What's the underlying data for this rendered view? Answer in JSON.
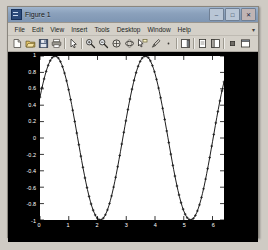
{
  "window": {
    "title": "Figure 1",
    "icon": "matlab-figure-icon",
    "controls": [
      {
        "name": "minimize",
        "glyph": "–"
      },
      {
        "name": "maximize",
        "glyph": "□"
      },
      {
        "name": "close",
        "glyph": "✕"
      }
    ]
  },
  "menubar": {
    "items": [
      {
        "label": "File",
        "mnemonic": "F"
      },
      {
        "label": "Edit",
        "mnemonic": "E"
      },
      {
        "label": "View",
        "mnemonic": "V"
      },
      {
        "label": "Insert",
        "mnemonic": "I"
      },
      {
        "label": "Tools",
        "mnemonic": "T"
      },
      {
        "label": "Desktop",
        "mnemonic": "D"
      },
      {
        "label": "Window",
        "mnemonic": "W"
      },
      {
        "label": "Help",
        "mnemonic": "H"
      }
    ],
    "overflow_glyph": "▾"
  },
  "toolbar": {
    "buttons": [
      {
        "name": "new-figure-icon",
        "tip": "New Figure"
      },
      {
        "name": "open-file-icon",
        "tip": "Open File"
      },
      {
        "name": "save-figure-icon",
        "tip": "Save Figure"
      },
      {
        "name": "print-figure-icon",
        "tip": "Print Figure"
      },
      {
        "name": "edit-plot-arrow-icon",
        "tip": "Edit Plot"
      },
      {
        "name": "zoom-in-icon",
        "tip": "Zoom In"
      },
      {
        "name": "zoom-out-icon",
        "tip": "Zoom Out"
      },
      {
        "name": "pan-icon",
        "tip": "Pan"
      },
      {
        "name": "rotate-3d-icon",
        "tip": "Rotate 3D"
      },
      {
        "name": "data-cursor-icon",
        "tip": "Data Cursor"
      },
      {
        "name": "brush-icon",
        "tip": "Brush/Select Data"
      },
      {
        "name": "link-plot-icon",
        "tip": "Link Plot"
      },
      {
        "name": "colorbar-icon",
        "tip": "Insert Colorbar"
      },
      {
        "name": "legend-icon",
        "tip": "Insert Legend"
      },
      {
        "name": "hide-plot-tools-icon",
        "tip": "Hide Plot Tools"
      },
      {
        "name": "show-plot-tools-icon",
        "tip": "Show Plot Tools and Dock Figure"
      }
    ]
  },
  "chart_data": {
    "type": "line",
    "title": "",
    "xlabel": "",
    "ylabel": "",
    "xlim": [
      0,
      6.4
    ],
    "ylim": [
      -1,
      1
    ],
    "grid": false,
    "legend": null,
    "xticks": [
      0,
      1,
      2,
      3,
      4,
      5,
      6
    ],
    "xticklabels": [
      "0",
      "1",
      "2",
      "3",
      "4",
      "5",
      "6"
    ],
    "yticks": [
      -1,
      -0.8,
      -0.6,
      -0.4,
      -0.2,
      0,
      0.2,
      0.4,
      0.6,
      0.8,
      1
    ],
    "yticklabels": [
      "-1",
      "-0.8",
      "-0.6",
      "-0.4",
      "-0.2",
      "0",
      "0.2",
      "0.4",
      "0.6",
      "0.8",
      "1"
    ],
    "series": [
      {
        "name": "cos(2x - 1)",
        "color": "#1a1a1a",
        "marker": "plus",
        "linestyle": "solid",
        "expression": "cos(2*x - 1.05)",
        "amplitude": 1,
        "frequency": 2,
        "phase": -1.05,
        "n_points": 128,
        "x": [
          0,
          0.05,
          0.1,
          0.15,
          0.2,
          0.25,
          0.3,
          0.35,
          0.4,
          0.45,
          0.5,
          0.55,
          0.6,
          0.65,
          0.7,
          0.75,
          0.8,
          0.85,
          0.9,
          0.95,
          1,
          1.1,
          1.2,
          1.3,
          1.4,
          1.5,
          1.6,
          1.7,
          1.8,
          1.9,
          2,
          2.1,
          2.2,
          2.3,
          2.4,
          2.5,
          2.6,
          2.7,
          2.8,
          2.9,
          3,
          3.1,
          3.2,
          3.3,
          3.4,
          3.5,
          3.6,
          3.7,
          3.8,
          3.9,
          4,
          4.1,
          4.2,
          4.3,
          4.4,
          4.5,
          4.6,
          4.7,
          4.8,
          4.9,
          5,
          5.1,
          5.2,
          5.3,
          5.4,
          5.5,
          5.6,
          5.7,
          5.8,
          5.9,
          6,
          6.1,
          6.2,
          6.3
        ],
        "y": [
          0.4976,
          0.5871,
          0.668,
          0.7396,
          0.8011,
          0.8519,
          0.8916,
          0.9198,
          0.9363,
          0.9409,
          0.9336,
          0.9146,
          0.8841,
          0.8426,
          0.7906,
          0.7288,
          0.658,
          0.5791,
          0.4932,
          0.4013,
          0.3046,
          0.101,
          -0.1104,
          -0.3173,
          -0.5075,
          -0.6696,
          -0.7937,
          -0.8721,
          -0.8996,
          -0.8744,
          -0.7975,
          -0.6731,
          -0.5087,
          -0.3141,
          -0.1014,
          0.1162,
          0.3255,
          0.5138,
          0.6701,
          0.7855,
          0.8539,
          0.8723,
          0.8407,
          0.7624,
          0.6437,
          0.4934,
          0.322,
          0.1395,
          -0.0434,
          -0.216,
          -0.369,
          -0.494,
          -0.5848,
          -0.637,
          -0.6486,
          -0.6195,
          -0.5517,
          -0.4496,
          -0.319,
          -0.1675,
          -0.0039,
          0.1623,
          0.3213,
          0.4637,
          0.581,
          0.6664,
          0.7146,
          0.7227,
          0.6902,
          0.6189,
          0.5131,
          0.3792,
          0.2254,
          0.0613
        ]
      }
    ]
  }
}
